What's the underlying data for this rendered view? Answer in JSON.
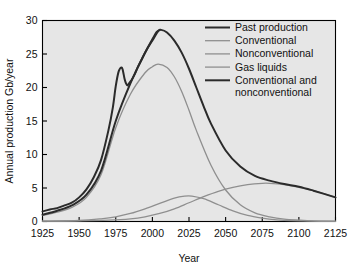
{
  "chart_data": {
    "type": "line",
    "title": "",
    "xlabel": "Year",
    "ylabel": "Annual production Gb/year",
    "xlim": [
      1925,
      2125
    ],
    "ylim": [
      0,
      30
    ],
    "xticks": [
      1925,
      1950,
      1975,
      2000,
      2025,
      2050,
      2075,
      2100,
      2125
    ],
    "yticks": [
      0,
      5,
      10,
      15,
      20,
      25,
      30
    ],
    "grid": false,
    "legend_position": "top-right",
    "colors": {
      "past_production": "#2b2b2b",
      "conventional": "#8f8f8f",
      "nonconventional": "#8f8f8f",
      "gas_liquids": "#8f8f8f",
      "conventional_and_nonconventional": "#2b2b2b",
      "plot_background": "#e6e6e6",
      "axis": "#000000",
      "page_background": "#ffffff"
    },
    "series": [
      {
        "name": "Past production",
        "color": "#2b2b2b",
        "width": 2.0,
        "x": [
          1925,
          1930,
          1935,
          1940,
          1945,
          1950,
          1955,
          1960,
          1965,
          1970,
          1973,
          1975,
          1977,
          1979,
          1980,
          1981,
          1982,
          1983,
          1984,
          1986,
          1988,
          1990,
          1993,
          1996,
          2000,
          2003,
          2005
        ],
        "y": [
          1.5,
          1.8,
          2.0,
          2.4,
          2.8,
          3.6,
          4.8,
          6.6,
          9.2,
          13.6,
          17.0,
          20.2,
          22.4,
          23.0,
          22.4,
          21.3,
          20.6,
          20.3,
          20.6,
          21.2,
          22.0,
          23.0,
          24.3,
          25.6,
          27.2,
          28.3,
          28.6
        ]
      },
      {
        "name": "Conventional",
        "color": "#8f8f8f",
        "width": 1.3,
        "x": [
          1925,
          1935,
          1945,
          1955,
          1965,
          1975,
          1985,
          1995,
          2000,
          2004,
          2010,
          2015,
          2020,
          2025,
          2030,
          2040,
          2050,
          2060,
          2070,
          2080,
          2090,
          2100,
          2110,
          2125
        ],
        "y": [
          0.9,
          1.4,
          2.1,
          3.6,
          7.0,
          14.0,
          19.0,
          22.2,
          23.1,
          23.5,
          23.0,
          21.6,
          19.4,
          16.6,
          13.6,
          8.4,
          4.7,
          2.5,
          1.3,
          0.7,
          0.35,
          0.2,
          0.1,
          0.05
        ]
      },
      {
        "name": "Nonconventional",
        "color": "#8f8f8f",
        "width": 1.3,
        "x": [
          1925,
          1950,
          1970,
          1985,
          1995,
          2005,
          2015,
          2025,
          2035,
          2045,
          2055,
          2065,
          2075,
          2080,
          2090,
          2100,
          2110,
          2125
        ],
        "y": [
          0.05,
          0.1,
          0.2,
          0.4,
          0.7,
          1.2,
          1.9,
          2.8,
          3.7,
          4.5,
          5.1,
          5.5,
          5.7,
          5.7,
          5.5,
          5.1,
          4.6,
          3.6
        ]
      },
      {
        "name": "Gas liquids",
        "color": "#8f8f8f",
        "width": 1.3,
        "x": [
          1925,
          1950,
          1965,
          1975,
          1985,
          1995,
          2005,
          2015,
          2022,
          2027,
          2035,
          2045,
          2055,
          2065,
          2075,
          2085,
          2095,
          2110,
          2125
        ],
        "y": [
          0.05,
          0.15,
          0.4,
          0.7,
          1.2,
          1.9,
          2.7,
          3.5,
          3.8,
          3.8,
          3.4,
          2.5,
          1.6,
          0.9,
          0.5,
          0.25,
          0.12,
          0.05,
          0.02
        ]
      },
      {
        "name": "Conventional and nonconventional",
        "color": "#2b2b2b",
        "width": 2.0,
        "x": [
          1925,
          1935,
          1945,
          1955,
          1965,
          1975,
          1985,
          1995,
          2000,
          2004,
          2006,
          2010,
          2015,
          2020,
          2025,
          2030,
          2035,
          2040,
          2050,
          2060,
          2070,
          2080,
          2090,
          2100,
          2110,
          2125
        ],
        "y": [
          1.0,
          1.6,
          2.4,
          4.0,
          7.6,
          15.0,
          20.6,
          25.2,
          27.0,
          28.4,
          28.6,
          28.2,
          27.0,
          25.2,
          22.8,
          20.0,
          17.2,
          14.6,
          10.6,
          8.2,
          6.8,
          6.1,
          5.6,
          5.2,
          4.6,
          3.6
        ]
      }
    ],
    "legend": [
      {
        "label": "Past production",
        "color": "#2b2b2b",
        "width": 2.0
      },
      {
        "label": "Conventional",
        "color": "#8f8f8f",
        "width": 1.3
      },
      {
        "label": "Nonconventional",
        "color": "#8f8f8f",
        "width": 1.3
      },
      {
        "label": "Gas liquids",
        "color": "#8f8f8f",
        "width": 1.3
      },
      {
        "label": "Conventional and",
        "label2": "nonconventional",
        "color": "#2b2b2b",
        "width": 2.0
      }
    ]
  }
}
